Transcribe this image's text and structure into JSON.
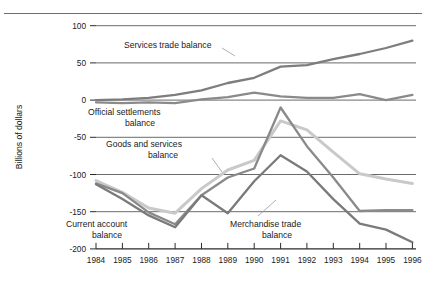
{
  "figure": {
    "width": 426,
    "height": 295,
    "background": "#ffffff",
    "top_rule_color": "#6e6e6e"
  },
  "chart_data": {
    "type": "line",
    "title": "",
    "xlabel": "",
    "ylabel": "Billions of dollars",
    "xlim": [
      1984,
      1996
    ],
    "ylim": [
      -200,
      100
    ],
    "yticks": [
      100,
      50,
      0,
      -50,
      -100,
      -150,
      -200
    ],
    "ytick_labels": [
      "100",
      "50",
      "0",
      "-50",
      "-100",
      "-150",
      "-200"
    ],
    "grid": "horizontal",
    "legend": "inline-annotations",
    "x": [
      1984,
      1985,
      1986,
      1987,
      1988,
      1989,
      1990,
      1991,
      1992,
      1993,
      1994,
      1995,
      1996
    ],
    "categories": [
      "1984",
      "1985",
      "1986",
      "1987",
      "1988",
      "1989",
      "1990",
      "1991",
      "1992",
      "1993",
      "1994",
      "1995",
      "1996"
    ],
    "series": [
      {
        "name": "Services trade balance",
        "color": "#7d7d7d",
        "width": 2.3,
        "values": [
          0,
          1,
          3,
          7,
          13,
          23,
          30,
          45,
          47,
          55,
          62,
          70,
          80
        ]
      },
      {
        "name": "Official settlements balance",
        "color": "#8a8a8a",
        "width": 2.3,
        "values": [
          -3,
          -4,
          -3,
          -4,
          1,
          4,
          10,
          5,
          3,
          3,
          8,
          0,
          7
        ]
      },
      {
        "name": "Goods and services balance",
        "color": "#c9c9c9",
        "width": 3.0,
        "values": [
          -108,
          -124,
          -145,
          -152,
          -119,
          -94,
          -81,
          -28,
          -40,
          -70,
          -99,
          -106,
          -112
        ]
      },
      {
        "name": "Current account balance",
        "color": "#8a8a8a",
        "width": 2.3,
        "values": [
          -112,
          -125,
          -151,
          -167,
          -128,
          -104,
          -92,
          -10,
          -62,
          -104,
          -149,
          -148,
          -148
        ]
      },
      {
        "name": "Merchandise trade balance",
        "color": "#7a7a7a",
        "width": 2.3,
        "values": [
          -113,
          -133,
          -155,
          -171,
          -128,
          -152,
          -109,
          -74,
          -96,
          -133,
          -166,
          -174,
          -191
        ]
      }
    ],
    "annotations": [
      {
        "name": "services-trade-balance",
        "text": "Services trade balance",
        "lines": [
          "Services trade balance"
        ]
      },
      {
        "name": "official-settlements-balance",
        "text": "Official settlements balance",
        "lines": [
          "Official settlements",
          "balance"
        ]
      },
      {
        "name": "goods-and-services-balance",
        "text": "Goods and services balance",
        "lines": [
          "Goods and services",
          "balance"
        ]
      },
      {
        "name": "current-account-balance",
        "text": "Current account balance",
        "lines": [
          "Current account",
          "balance"
        ]
      },
      {
        "name": "merchandise-trade-balance",
        "text": "Merchandise trade balance",
        "lines": [
          "Merchandise trade",
          "balance"
        ]
      }
    ]
  },
  "axis": {
    "y_title": "Billions of dollars",
    "y_labels": [
      "100",
      "50",
      "0",
      "-50",
      "-100",
      "-150",
      "-200"
    ],
    "x_labels": [
      "1984",
      "1985",
      "1986",
      "1987",
      "1988",
      "1989",
      "1990",
      "1991",
      "1992",
      "1993",
      "1994",
      "1995",
      "1996"
    ]
  },
  "annotations": {
    "services": "Services trade balance",
    "official_1": "Official settlements",
    "official_2": "balance",
    "goods_1": "Goods and services",
    "goods_2": "balance",
    "current_1": "Current account",
    "current_2": "balance",
    "merch_1": "Merchandise trade",
    "merch_2": "balance"
  }
}
